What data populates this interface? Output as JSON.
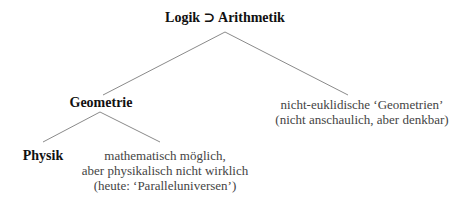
{
  "diagram": {
    "root": {
      "label": "Logik ⊃ Arithmetik"
    },
    "level1": {
      "left": {
        "label": "Geometrie"
      },
      "right": {
        "lines": [
          "nicht-euklidische ‘Geometrien’",
          "(nicht anschaulich, aber denkbar)"
        ]
      }
    },
    "level2": {
      "left": {
        "label": "Physik"
      },
      "right": {
        "lines": [
          "mathematisch möglich,",
          "aber physikalisch nicht wirklich",
          "(heute: ‘Paralleluniversen’)"
        ]
      }
    },
    "colors": {
      "edge": "#8a8a8a",
      "bold_text": "#111111",
      "note_text": "#444444",
      "background": "#ffffff"
    }
  }
}
